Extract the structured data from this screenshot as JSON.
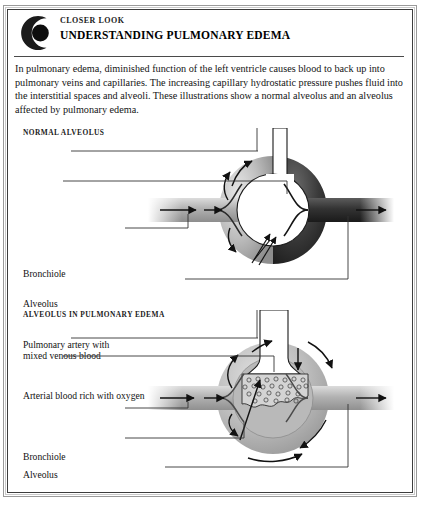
{
  "document": {
    "kicker": "CLOSER LOOK",
    "title": "UNDERSTANDING PULMONARY EDEMA",
    "logo_icon": "crescent-eye-logo-icon",
    "intro": "In pulmonary edema, diminished function of the left ventricle causes blood to back up into pulmonary veins and capillaries. The increasing capillary hydrostatic pressure pushes fluid into the interstitial spaces and alveoli. These illustrations show a normal alveolus and an alveolus affected by pulmonary edema."
  },
  "panels": [
    {
      "heading": "NORMAL ALVEOLUS",
      "labels": [
        {
          "key": "bronchiole",
          "text": "Bronchiole"
        },
        {
          "key": "alveolus",
          "text": "Alveolus"
        },
        {
          "key": "pulmonary_artery_1",
          "text": "Pulmonary artery with"
        },
        {
          "key": "pulmonary_artery_2",
          "text": "mixed venous blood"
        },
        {
          "key": "arterial_blood",
          "text": "Arterial blood rich with oxygen"
        }
      ]
    },
    {
      "heading": "ALVEOLUS IN PULMONARY EDEMA",
      "labels": [
        {
          "key": "bronchiole",
          "text": "Bronchiole"
        },
        {
          "key": "alveolus",
          "text": "Alveolus"
        },
        {
          "key": "pulmonary_artery_1",
          "text": "Pulmonary artery with"
        },
        {
          "key": "pulmonary_artery_2",
          "text": "mixed venous blood"
        },
        {
          "key": "interstitial",
          "text": "Interstitial congestion"
        },
        {
          "key": "arterial_blood",
          "text": "Arterial blood lacking oxygen"
        }
      ]
    }
  ],
  "colors": {
    "ink": "#121212",
    "frame_dark": "#3d3d3d",
    "frame_mid": "#9a9a9a",
    "frame_light": "#c9c9c9",
    "capillary_venous": "#b4b4b4",
    "capillary_arterial": "#3a3a3a",
    "edema_fill": "#b9b9b9",
    "edema_fluid": "#d2d2d2",
    "page_bg": "#ffffff"
  }
}
